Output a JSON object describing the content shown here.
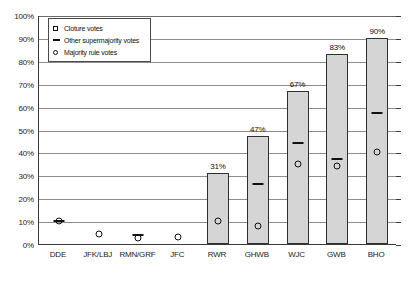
{
  "chart_data": {
    "type": "bar",
    "title": "",
    "xlabel": "",
    "ylabel": "",
    "ylim": [
      0,
      100
    ],
    "grid": true,
    "legend_position": "top-left inside plot",
    "categories": [
      "DDE",
      "JFK/LBJ",
      "RMN/GRF",
      "JFC",
      "RWR",
      "GHWB",
      "WJC",
      "GWB",
      "BHO"
    ],
    "ytick_labels": [
      "0%",
      "10%",
      "20%",
      "30%",
      "40%",
      "50%",
      "60%",
      "70%",
      "80%",
      "90%",
      "100%"
    ],
    "ytick_values": [
      0,
      10,
      20,
      30,
      40,
      50,
      60,
      70,
      80,
      90,
      100
    ],
    "series": [
      {
        "name": "Cloture votes",
        "marker": "square",
        "render": "bar",
        "values": [
          0,
          0,
          0,
          0,
          31,
          47,
          67,
          83,
          90
        ],
        "data_labels": [
          "",
          "",
          "",
          "",
          "31%",
          "47%",
          "67%",
          "83%",
          "90%"
        ]
      },
      {
        "name": "Other supermajority votes",
        "marker": "dash",
        "render": "point",
        "values": [
          10,
          null,
          4,
          null,
          null,
          26,
          44,
          37,
          57
        ]
      },
      {
        "name": "Majority rule votes",
        "marker": "circle",
        "render": "point",
        "values": [
          10,
          4.5,
          2.5,
          3,
          10,
          8,
          35,
          34,
          40
        ]
      }
    ]
  },
  "legend": {
    "items": [
      {
        "label": "Cloture votes",
        "marker": "square"
      },
      {
        "label": "Other supermajority votes",
        "marker": "dash"
      },
      {
        "label": "Majority rule votes",
        "marker": "circle"
      }
    ]
  },
  "colors": {
    "bar_fill": "#d5d5d5",
    "bar_stroke": "#2f2f2f",
    "gridline": "#8d8d8d",
    "axis": "#3a3a3a",
    "text": "#1a1a1a",
    "marker": "#111111",
    "background": "#ffffff"
  }
}
